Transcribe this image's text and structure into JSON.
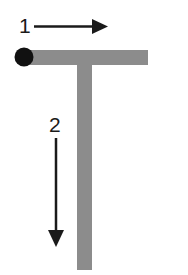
{
  "diagram": {
    "shape": "T",
    "labels": {
      "arrow1": "1",
      "arrow2": "2"
    },
    "arrows": [
      {
        "id": "arrow1",
        "label": "1",
        "direction": "right"
      },
      {
        "id": "arrow2",
        "label": "2",
        "direction": "down"
      }
    ],
    "start_marker": "start-dot",
    "colors": {
      "bar": "#8c8c8c",
      "dot": "#111111",
      "arrow": "#1a1a1a",
      "background": "#ffffff"
    }
  }
}
